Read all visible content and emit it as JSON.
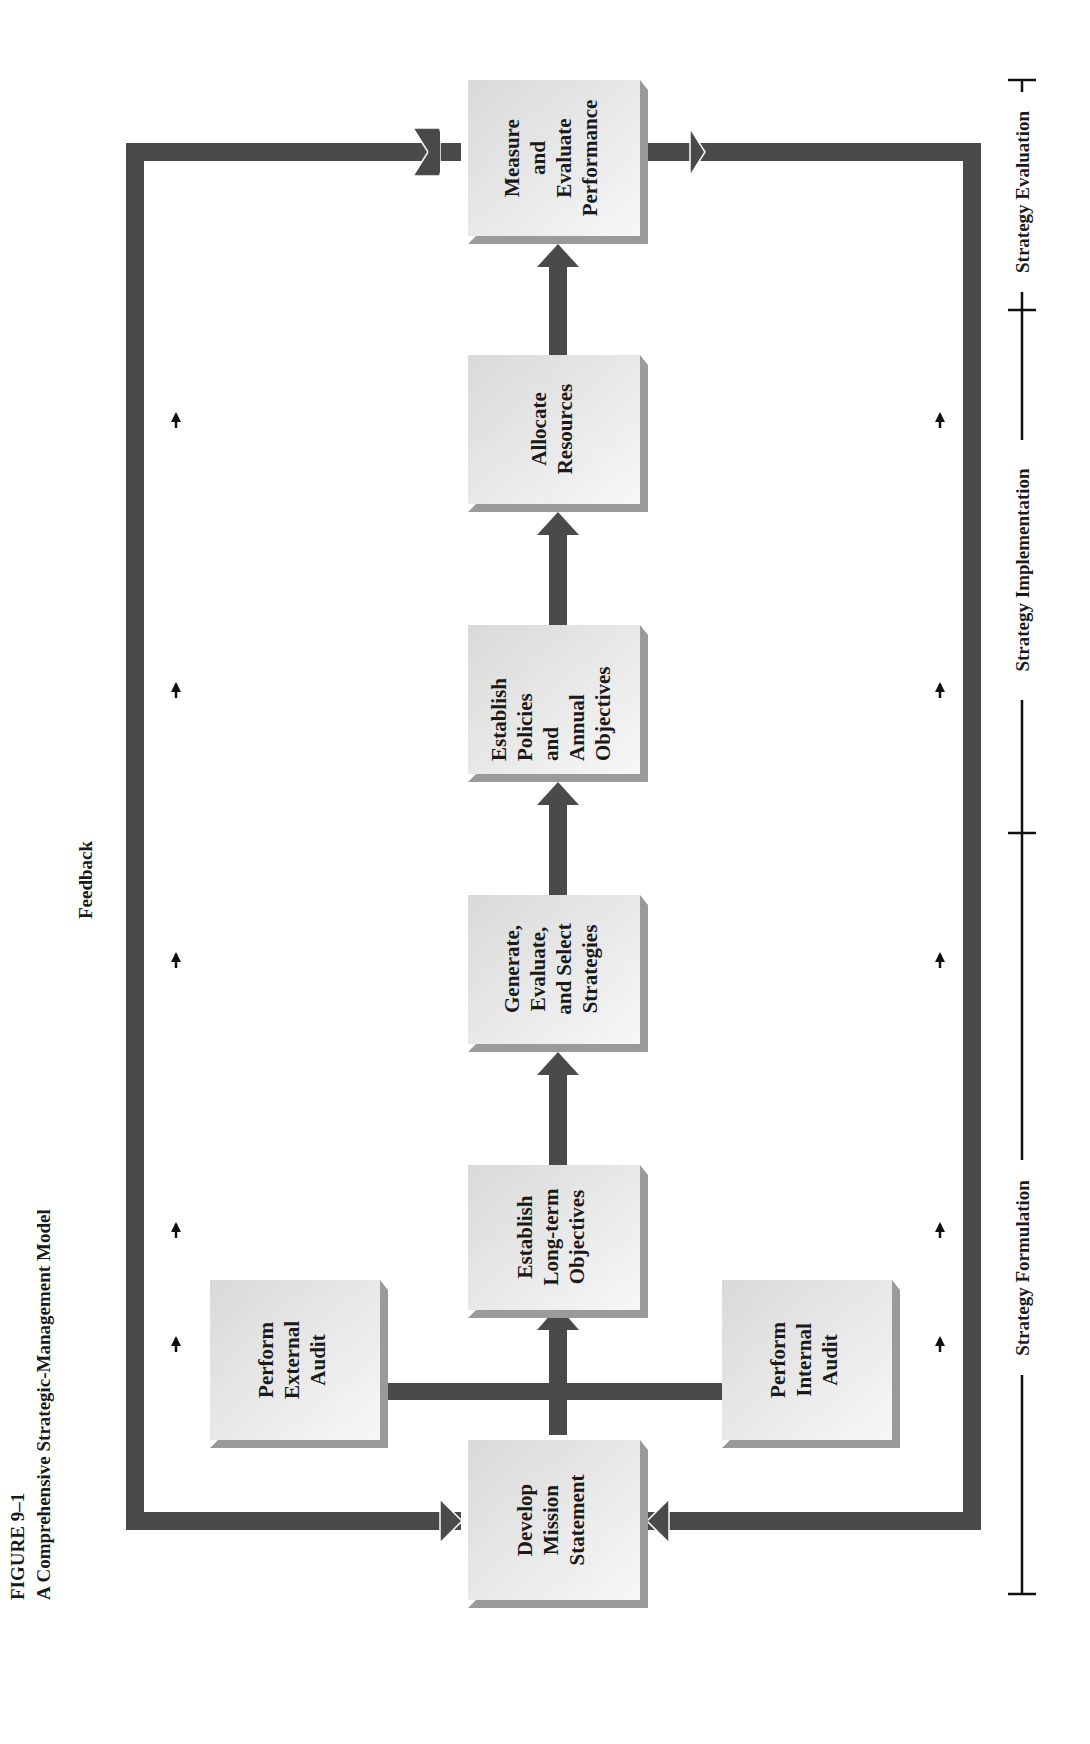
{
  "figure": {
    "number": "FIGURE 9–1",
    "title": "A Comprehensive Strategic-Management Model"
  },
  "feedback": {
    "label": "Feedback"
  },
  "boxes": [
    {
      "id": "mission",
      "lines": [
        "Develop",
        "Mission",
        "Statement"
      ]
    },
    {
      "id": "external",
      "lines": [
        "Perform",
        "External",
        "Audit"
      ]
    },
    {
      "id": "internal",
      "lines": [
        "Perform",
        "Internal",
        "Audit"
      ]
    },
    {
      "id": "longterm",
      "lines": [
        "Establish",
        "Long-term",
        "Objectives"
      ]
    },
    {
      "id": "strategies",
      "lines": [
        "Generate,",
        "Evaluate,",
        "and Select",
        "Strategies"
      ]
    },
    {
      "id": "policies",
      "lines": [
        "Establish",
        "Policies",
        "and",
        "Annual",
        "Objectives"
      ]
    },
    {
      "id": "resources",
      "lines": [
        "Allocate",
        "Resources"
      ]
    },
    {
      "id": "measure",
      "lines": [
        "Measure",
        "and",
        "Evaluate",
        "Performance"
      ]
    }
  ],
  "phases": [
    {
      "label": "Strategy Formulation"
    },
    {
      "label": "Strategy Implementation"
    },
    {
      "label": "Strategy Evaluation"
    }
  ],
  "colors": {
    "arrow": "#4a4a4a",
    "box_face": "#ececec",
    "box_shadow": "#9a9a9a",
    "text": "#1a1a1a"
  }
}
